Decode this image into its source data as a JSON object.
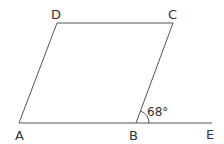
{
  "diagram": {
    "type": "parallelogram",
    "vertices": {
      "A": {
        "label": "A",
        "x": 19,
        "y": 123
      },
      "B": {
        "label": "B",
        "x": 136,
        "y": 123
      },
      "C": {
        "label": "C",
        "x": 173,
        "y": 23
      },
      "D": {
        "label": "D",
        "x": 57,
        "y": 23
      }
    },
    "extension": {
      "label": "E",
      "x": 212,
      "y": 123
    },
    "angle": {
      "label": "68°",
      "at": "B",
      "between": [
        "C",
        "E"
      ]
    },
    "line_color": "#555555"
  }
}
